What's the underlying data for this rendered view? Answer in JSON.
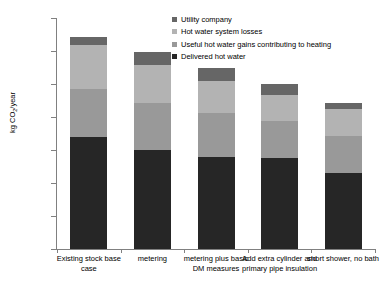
{
  "chart_data": {
    "type": "bar",
    "stacked": true,
    "title": "",
    "xlabel": "",
    "ylabel": "kg CO2/year",
    "ylim": [
      0,
      1400
    ],
    "yticks": [
      0,
      200,
      400,
      600,
      800,
      1000,
      1200,
      1400
    ],
    "ytick_labels": [
      "0",
      "200",
      "400",
      "600",
      "800",
      "1000",
      "1200",
      "1400"
    ],
    "grid": false,
    "legend_position": "top-right",
    "categories": [
      "Existing stock base case",
      "metering",
      "metering plus basic DM measures",
      "Add extra cylinder and primary pipe insulation",
      "short shower, no bath"
    ],
    "series": [
      {
        "name": "Delivered hot water",
        "color": "#262626",
        "values": [
          680,
          602,
          557,
          553,
          460
        ]
      },
      {
        "name": "Useful hot water gains contributing to heating",
        "color": "#999999",
        "values": [
          288,
          285,
          268,
          220,
          225
        ]
      },
      {
        "name": "Hot water system losses",
        "color": "#b3b3b3",
        "values": [
          270,
          228,
          195,
          163,
          163
        ]
      },
      {
        "name": "Utility company",
        "color": "#666666",
        "values": [
          47,
          77,
          75,
          64,
          35
        ]
      }
    ],
    "bar_totals": [
      1285,
      1192,
      1095,
      1000,
      883
    ]
  },
  "legend": {
    "items": [
      {
        "label": "Utility company",
        "color": "#666666",
        "swatch_name": "legend-swatch-utility-company"
      },
      {
        "label": "Hot water system losses",
        "color": "#b3b3b3",
        "swatch_name": "legend-swatch-hot-water-system-losses"
      },
      {
        "label": "Useful hot water gains contributing to heating",
        "color": "#999999",
        "swatch_name": "legend-swatch-useful-hot-water-gains"
      },
      {
        "label": "Delivered hot water",
        "color": "#262626",
        "swatch_name": "legend-swatch-delivered-hot-water"
      }
    ]
  },
  "axes": {
    "y_title_main": "kg CO",
    "y_title_sub": "2",
    "y_title_tail": "/year"
  }
}
